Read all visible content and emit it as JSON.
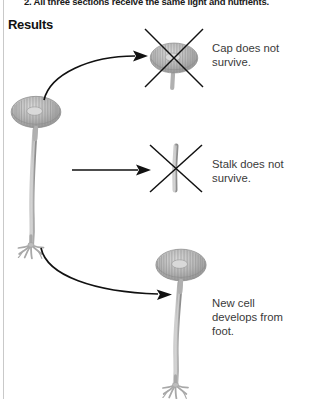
{
  "page": {
    "step_text": "2. All three sections receive the same light and nutrients.",
    "results_heading": "Results"
  },
  "colors": {
    "algae_fill": "#b7b7b7",
    "algae_shade": "#8f8f8f",
    "algae_light": "#d2d2d2",
    "algae_outline": "#7a7a7a",
    "arrow": "#111111",
    "cross_mark": "#111111",
    "caption_text": "#3a3a3a",
    "heading_text": "#111111",
    "rule": "#c9c9c9",
    "background": "#ffffff"
  },
  "results": [
    {
      "id": "cap",
      "caption": "Cap does not\nsurvive.",
      "arrow_type": "curved-up",
      "outcome_icon": "cap-crossed-out",
      "crossed_out": true
    },
    {
      "id": "stalk",
      "caption": "Stalk does not\nsurvive.",
      "arrow_type": "straight",
      "outcome_icon": "stalk-crossed-out",
      "crossed_out": true
    },
    {
      "id": "foot",
      "caption": "New cell\ndevelops from\nfoot.",
      "arrow_type": "curved-down",
      "outcome_icon": "regenerated-cell",
      "crossed_out": false
    }
  ],
  "source_organism": {
    "name": "acetabularia-cell",
    "parts": [
      "cap",
      "stalk",
      "foot"
    ]
  }
}
